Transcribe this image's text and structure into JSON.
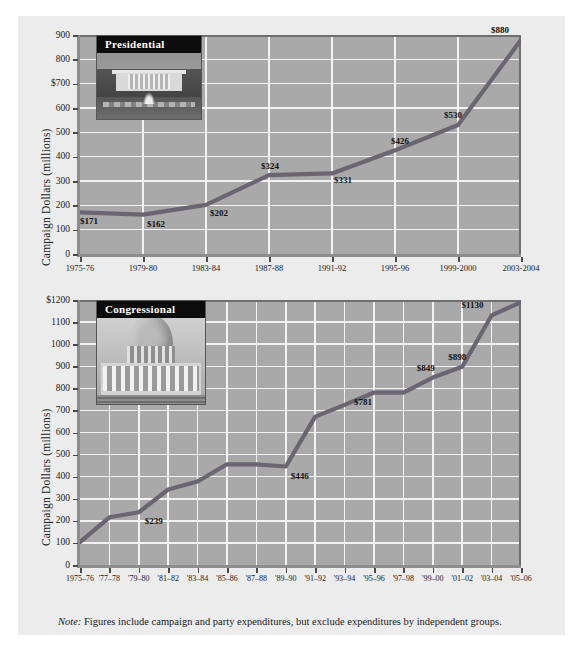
{
  "figure": {
    "background_color": "#ececec",
    "plot_background_color": "#a9a9a9",
    "gridline_color": "#f2f2f2",
    "line_color": "#6b6472",
    "note_prefix": "Note:",
    "note_text": " Figures include campaign and party expenditures, but exclude expenditures by independent groups."
  },
  "chart_data": [
    {
      "type": "line",
      "title": "Presidential",
      "photo": "white-house-photo",
      "xlabel": "",
      "ylabel": "Campaign Dollars (millions)",
      "ylim": [
        0,
        900
      ],
      "ytick_labels": [
        "0",
        "100",
        "200",
        "300",
        "400",
        "500",
        "600",
        "$700",
        "800",
        "900"
      ],
      "ytick_values": [
        0,
        100,
        200,
        300,
        400,
        500,
        600,
        700,
        800,
        900
      ],
      "grid": true,
      "legend": "none",
      "categories": [
        "1975-76",
        "1979-80",
        "1983-84",
        "1987-88",
        "1991-92",
        "1995-96",
        "1999-2000",
        "2003-2004"
      ],
      "values": [
        171,
        162,
        202,
        324,
        331,
        426,
        530,
        880
      ],
      "point_labels": [
        "$171",
        "$162",
        "$202",
        "$324",
        "$331",
        "$426",
        "$530",
        "$880"
      ]
    },
    {
      "type": "line",
      "title": "Congressional",
      "photo": "capitol-photo",
      "xlabel": "",
      "ylabel": "Campaign Dollars (millions)",
      "ylim": [
        0,
        1200
      ],
      "ytick_labels": [
        "0",
        "100",
        "200",
        "300",
        "400",
        "500",
        "600",
        "700",
        "800",
        "900",
        "1000",
        "1100",
        "$1200"
      ],
      "ytick_values": [
        0,
        100,
        200,
        300,
        400,
        500,
        600,
        700,
        800,
        900,
        1000,
        1100,
        1200
      ],
      "grid": true,
      "legend": "none",
      "categories": [
        "1975–76",
        "'77–78",
        "'79–80",
        "'81–82",
        "'83–84",
        "'85–86",
        "'87–88",
        "'89–90",
        "'91–92",
        "'93–94",
        "'95–96",
        "'97–98",
        "'99–00",
        "'01–02",
        "'03–04",
        "'05–06"
      ],
      "values": [
        104,
        216,
        239,
        342,
        378,
        456,
        456,
        446,
        672,
        725,
        781,
        781,
        849,
        898,
        1130,
        1190
      ],
      "point_labels": {
        "2": "$239",
        "7": "$446",
        "10": "$781",
        "12": "$849",
        "13": "$898",
        "14": "$1130"
      }
    }
  ]
}
